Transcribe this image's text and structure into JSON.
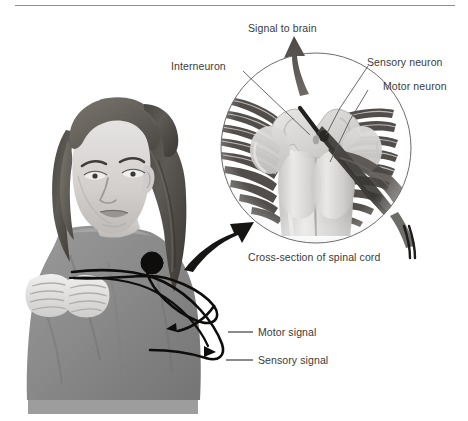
{
  "figure": {
    "title_rule": "horizontal-divider",
    "background_color": "#ffffff",
    "ink_color": "#3a3a3a"
  },
  "labels": {
    "signal_to_brain": "Signal to brain",
    "interneuron": "Interneuron",
    "sensory_neuron": "Sensory neuron",
    "motor_neuron": "Motor neuron",
    "cross_section": "Cross-section of spinal cord",
    "motor_signal": "Motor signal",
    "sensory_signal": "Sensory signal"
  },
  "illustration": {
    "subject": "girl-with-clenched-fists",
    "inset": "spinal-cord-cross-section-circle",
    "arrows": [
      {
        "name": "signal-to-brain-arrow",
        "direction": "up"
      },
      {
        "name": "magnifier-pointer-arrow",
        "direction": "up-right"
      },
      {
        "name": "motor-signal-loop",
        "direction": "toward-hand"
      },
      {
        "name": "sensory-signal-loop",
        "direction": "toward-spine"
      }
    ]
  }
}
